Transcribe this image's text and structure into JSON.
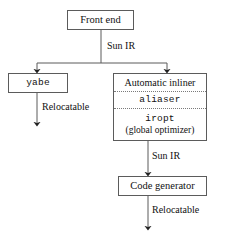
{
  "diagram": {
    "type": "flowchart",
    "line_color": "#5b5b5b",
    "dotted_divider_color": "#7a7a7a",
    "text_color": "#111111",
    "background": "#ffffff",
    "nodes": [
      {
        "id": "front-end",
        "label": "Front end"
      },
      {
        "id": "yabe",
        "label": "yabe",
        "font": "monospace"
      },
      {
        "id": "automatic-inliner",
        "label": "Automatic inliner"
      },
      {
        "id": "aliaser",
        "label": "aliaser",
        "font": "monospace"
      },
      {
        "id": "iropt",
        "label": "iropt",
        "font": "monospace"
      },
      {
        "id": "iropt-sub",
        "label": "(global optimizer)"
      },
      {
        "id": "code-generator",
        "label": "Code generator"
      }
    ],
    "edge_labels": {
      "front_end_out": "Sun IR",
      "yabe_out": "Relocatable",
      "inliner_out": "Sun IR",
      "code_generator_out": "Relocatable"
    }
  }
}
